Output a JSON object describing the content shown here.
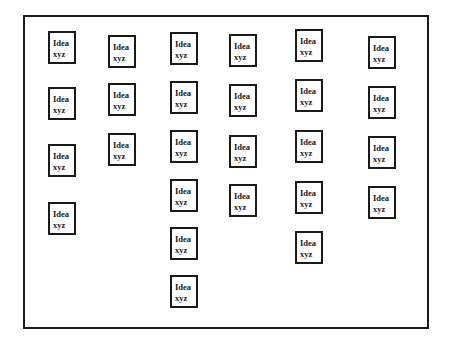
{
  "diagram": {
    "type": "idea-card-board",
    "card_text": {
      "line1": "Idea",
      "line2": "xyz"
    },
    "colors": {
      "border": "#1a1a1a",
      "background": "#ffffff"
    },
    "columns": [
      {
        "cards": [
          {
            "x": 48,
            "y": 31
          },
          {
            "x": 48,
            "y": 87
          },
          {
            "x": 48,
            "y": 144
          },
          {
            "x": 48,
            "y": 202
          }
        ]
      },
      {
        "cards": [
          {
            "x": 108,
            "y": 35
          },
          {
            "x": 108,
            "y": 83
          },
          {
            "x": 108,
            "y": 133
          }
        ]
      },
      {
        "cards": [
          {
            "x": 170,
            "y": 32
          },
          {
            "x": 170,
            "y": 81
          },
          {
            "x": 170,
            "y": 130
          },
          {
            "x": 170,
            "y": 179
          },
          {
            "x": 170,
            "y": 227
          },
          {
            "x": 170,
            "y": 275
          }
        ]
      },
      {
        "cards": [
          {
            "x": 229,
            "y": 34
          },
          {
            "x": 229,
            "y": 84
          },
          {
            "x": 229,
            "y": 135
          },
          {
            "x": 229,
            "y": 184
          }
        ]
      },
      {
        "cards": [
          {
            "x": 295,
            "y": 29
          },
          {
            "x": 295,
            "y": 79
          },
          {
            "x": 295,
            "y": 130
          },
          {
            "x": 295,
            "y": 181
          },
          {
            "x": 295,
            "y": 231
          }
        ]
      },
      {
        "cards": [
          {
            "x": 368,
            "y": 36
          },
          {
            "x": 368,
            "y": 86
          },
          {
            "x": 368,
            "y": 136
          },
          {
            "x": 368,
            "y": 186
          }
        ]
      }
    ]
  }
}
